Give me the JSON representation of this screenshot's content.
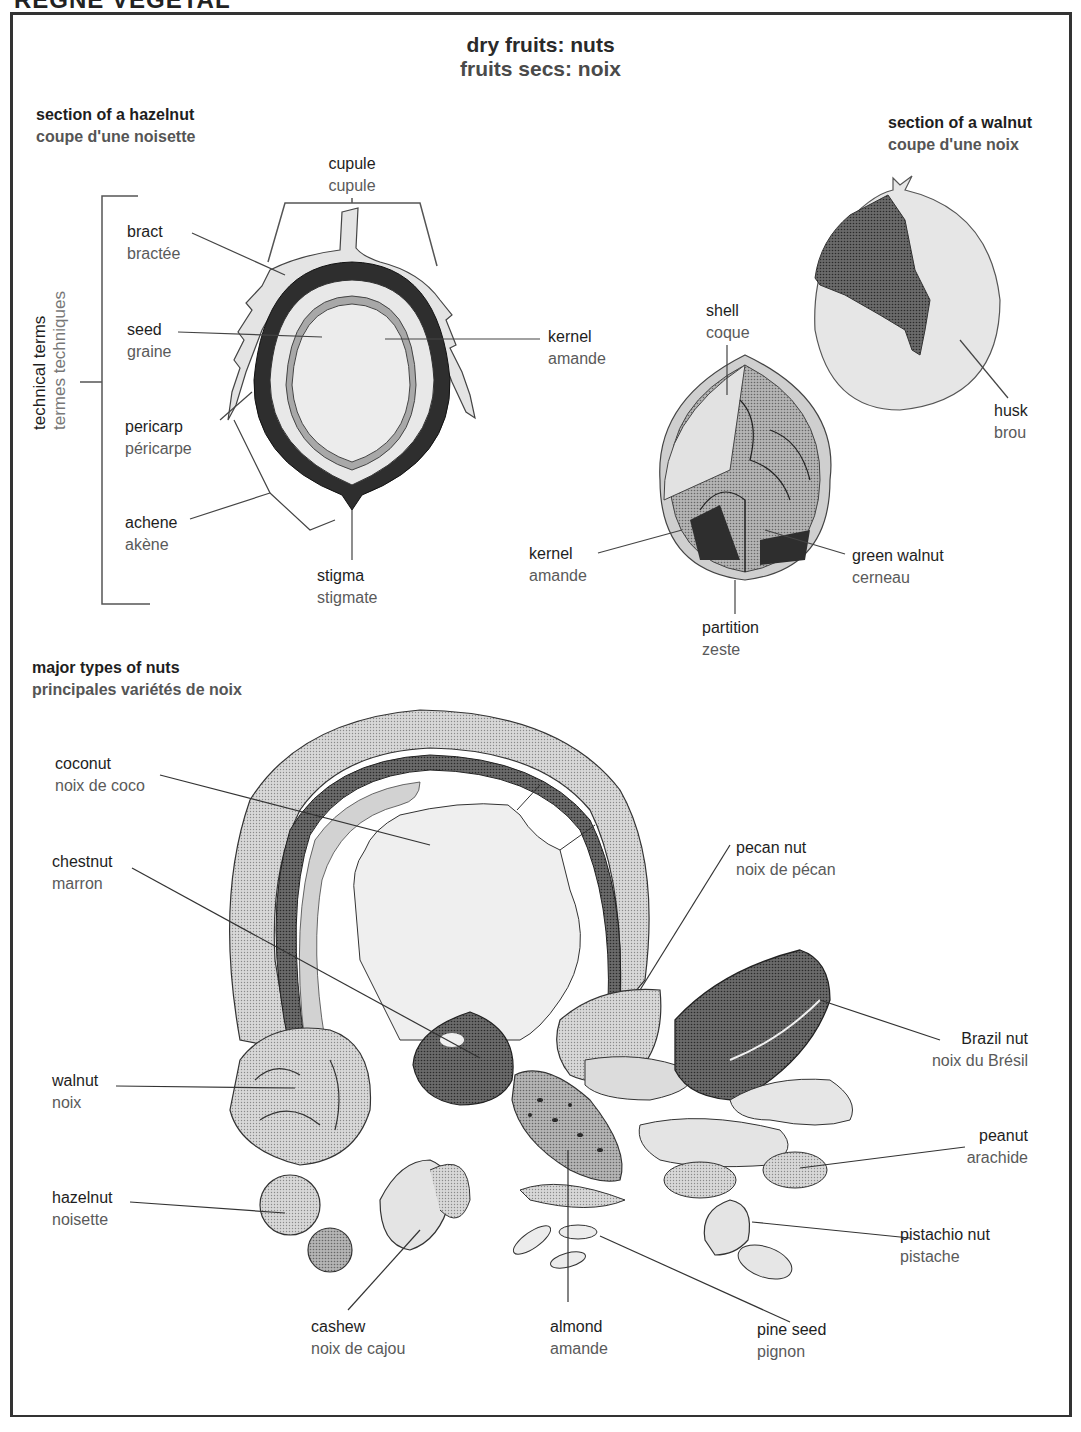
{
  "header": {
    "running_title": "RÈGNE VÉGÉTAL"
  },
  "title": {
    "en": "dry fruits: nuts",
    "fr": "fruits secs: noix"
  },
  "hazelnut_section": {
    "heading": {
      "en": "section of a hazelnut",
      "fr": "coupe d'une noisette"
    },
    "bracket_label": {
      "en": "technical terms",
      "fr": "termes techniques"
    },
    "labels": [
      {
        "id": "cupule",
        "en": "cupule",
        "fr": "cupule"
      },
      {
        "id": "bract",
        "en": "bract",
        "fr": "bractée"
      },
      {
        "id": "seed",
        "en": "seed",
        "fr": "graine"
      },
      {
        "id": "pericarp",
        "en": "pericarp",
        "fr": "péricarpe"
      },
      {
        "id": "achene",
        "en": "achene",
        "fr": "akène"
      },
      {
        "id": "stigma",
        "en": "stigma",
        "fr": "stigmate"
      },
      {
        "id": "kernel",
        "en": "kernel",
        "fr": "amande"
      }
    ]
  },
  "walnut_section": {
    "heading": {
      "en": "section of a walnut",
      "fr": "coupe d'une noix"
    },
    "labels": [
      {
        "id": "shell",
        "en": "shell",
        "fr": "coque"
      },
      {
        "id": "husk",
        "en": "husk",
        "fr": "brou"
      },
      {
        "id": "kernel",
        "en": "kernel",
        "fr": "amande"
      },
      {
        "id": "green-walnut",
        "en": "green walnut",
        "fr": "cerneau"
      },
      {
        "id": "partition",
        "en": "partition",
        "fr": "zeste"
      }
    ]
  },
  "nut_types": {
    "heading": {
      "en": "major types of nuts",
      "fr": "principales variétés de noix"
    },
    "labels": [
      {
        "id": "coconut",
        "en": "coconut",
        "fr": "noix de coco"
      },
      {
        "id": "chestnut",
        "en": "chestnut",
        "fr": "marron"
      },
      {
        "id": "walnut",
        "en": "walnut",
        "fr": "noix"
      },
      {
        "id": "hazelnut",
        "en": "hazelnut",
        "fr": "noisette"
      },
      {
        "id": "cashew",
        "en": "cashew",
        "fr": "noix de cajou"
      },
      {
        "id": "almond",
        "en": "almond",
        "fr": "amande"
      },
      {
        "id": "pine-seed",
        "en": "pine seed",
        "fr": "pignon"
      },
      {
        "id": "pistachio",
        "en": "pistachio nut",
        "fr": "pistache"
      },
      {
        "id": "peanut",
        "en": "peanut",
        "fr": "arachide"
      },
      {
        "id": "brazil",
        "en": "Brazil nut",
        "fr": "noix du Brésil"
      },
      {
        "id": "pecan",
        "en": "pecan nut",
        "fr": "noix de pécan"
      }
    ]
  },
  "colors": {
    "ink": "#1e1e1e",
    "french_text": "#5a5a5a",
    "light_fill": "#e6e6e6",
    "mid_fill": "#a8a8a8",
    "dark_fill": "#4a4a4a"
  }
}
